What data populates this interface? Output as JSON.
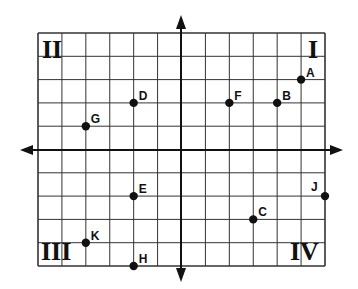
{
  "diagram": {
    "type": "coordinate-plane",
    "grid": {
      "columns": 12,
      "rows": 10,
      "x_range": [
        -6,
        6
      ],
      "y_range": [
        -5,
        5
      ]
    },
    "colors": {
      "line": "#222222",
      "point": "#111111",
      "background": "#ffffff"
    },
    "quadrants": [
      {
        "id": "q1",
        "label": "I"
      },
      {
        "id": "q2",
        "label": "II"
      },
      {
        "id": "q3",
        "label": "III"
      },
      {
        "id": "q4",
        "label": "IV"
      }
    ],
    "points": [
      {
        "label": "A",
        "x": 5,
        "y": 3
      },
      {
        "label": "B",
        "x": 4,
        "y": 2
      },
      {
        "label": "C",
        "x": 3,
        "y": -3
      },
      {
        "label": "D",
        "x": -2,
        "y": 2
      },
      {
        "label": "E",
        "x": -2,
        "y": -2
      },
      {
        "label": "F",
        "x": 2,
        "y": 2
      },
      {
        "label": "G",
        "x": -4,
        "y": 1
      },
      {
        "label": "H",
        "x": -2,
        "y": -5
      },
      {
        "label": "J",
        "x": 6,
        "y": -2
      },
      {
        "label": "K",
        "x": -4,
        "y": -4
      }
    ]
  }
}
